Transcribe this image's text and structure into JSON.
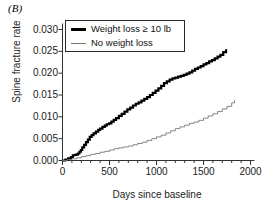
{
  "panel": {
    "label": "(B)"
  },
  "axes": {
    "xlabel": "Days since baseline",
    "ylabel": "Spine fracture rate",
    "xticks": [
      "0",
      "500",
      "1000",
      "1500",
      "2000"
    ],
    "yticks": [
      "0.000",
      "0.005",
      "0.010",
      "0.015",
      "0.020",
      "0.025",
      "0.030"
    ]
  },
  "legend": {
    "items": [
      {
        "label": "Weight loss ≥ 10 lb",
        "style": "thick",
        "color": "#000000"
      },
      {
        "label": "No weight loss",
        "style": "thin",
        "color": "#777777"
      }
    ]
  },
  "chart_data": {
    "type": "line",
    "title": "(B)",
    "xlabel": "Days since baseline",
    "ylabel": "Spine fracture rate",
    "xlim": [
      0,
      2000
    ],
    "ylim": [
      0.0,
      0.03
    ],
    "xticks": [
      0,
      500,
      1000,
      1500,
      2000
    ],
    "yticks": [
      0.0,
      0.005,
      0.01,
      0.015,
      0.02,
      0.025,
      0.03
    ],
    "xminor_tick_interval": 100,
    "grid": false,
    "legend_position": "upper-left-inside",
    "series": [
      {
        "name": "Weight loss ≥ 10 lb",
        "color": "#000000",
        "linewidth": 2.2,
        "step": true,
        "x": [
          0,
          30,
          60,
          90,
          110,
          130,
          150,
          165,
          180,
          195,
          210,
          230,
          250,
          270,
          290,
          310,
          330,
          355,
          380,
          400,
          425,
          450,
          470,
          495,
          520,
          545,
          570,
          600,
          630,
          660,
          690,
          720,
          750,
          780,
          810,
          840,
          870,
          900,
          930,
          960,
          990,
          1020,
          1050,
          1080,
          1110,
          1140,
          1170,
          1200,
          1230,
          1260,
          1290,
          1320,
          1350,
          1380,
          1410,
          1440,
          1470,
          1500,
          1530,
          1560,
          1590,
          1620,
          1650,
          1680,
          1710,
          1740
        ],
        "y": [
          0.0,
          0.0002,
          0.0005,
          0.0008,
          0.0012,
          0.0013,
          0.0014,
          0.0016,
          0.002,
          0.0024,
          0.003,
          0.0036,
          0.0042,
          0.0048,
          0.0054,
          0.0058,
          0.0062,
          0.0066,
          0.007,
          0.0073,
          0.0077,
          0.008,
          0.0083,
          0.0085,
          0.0089,
          0.0093,
          0.0097,
          0.0102,
          0.0107,
          0.0112,
          0.0117,
          0.0121,
          0.0126,
          0.013,
          0.0133,
          0.0137,
          0.0141,
          0.0145,
          0.015,
          0.0155,
          0.016,
          0.0165,
          0.0171,
          0.0177,
          0.0181,
          0.0185,
          0.0188,
          0.019,
          0.0192,
          0.0194,
          0.0196,
          0.0199,
          0.0202,
          0.0206,
          0.021,
          0.0213,
          0.0216,
          0.022,
          0.0223,
          0.0227,
          0.023,
          0.0234,
          0.0238,
          0.0242,
          0.0248,
          0.0255
        ]
      },
      {
        "name": "No weight loss",
        "color": "#777777",
        "linewidth": 0.9,
        "step": true,
        "x": [
          0,
          50,
          100,
          150,
          200,
          250,
          300,
          350,
          400,
          450,
          500,
          550,
          600,
          650,
          700,
          750,
          800,
          850,
          900,
          950,
          1000,
          1050,
          1100,
          1150,
          1200,
          1250,
          1300,
          1350,
          1400,
          1450,
          1500,
          1550,
          1600,
          1650,
          1700,
          1750,
          1800,
          1830
        ],
        "y": [
          0.0,
          0.0002,
          0.0004,
          0.0006,
          0.0009,
          0.0011,
          0.0014,
          0.0016,
          0.0019,
          0.0021,
          0.0024,
          0.0027,
          0.0029,
          0.0031,
          0.0033,
          0.0036,
          0.0039,
          0.0042,
          0.0046,
          0.005,
          0.0054,
          0.0058,
          0.0063,
          0.0068,
          0.0073,
          0.0077,
          0.0081,
          0.0085,
          0.0088,
          0.0092,
          0.0097,
          0.0102,
          0.0107,
          0.0112,
          0.0118,
          0.0124,
          0.0132,
          0.0138
        ]
      }
    ]
  }
}
